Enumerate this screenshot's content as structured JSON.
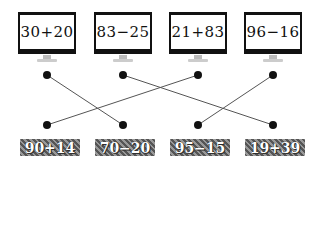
{
  "monitors": [
    {
      "expression": "30+20"
    },
    {
      "expression": "83−25"
    },
    {
      "expression": "21+83"
    },
    {
      "expression": "96−16"
    }
  ],
  "answers": [
    {
      "expression": "90+14"
    },
    {
      "expression": "70−20"
    },
    {
      "expression": "95−15"
    },
    {
      "expression": "19+39"
    }
  ],
  "connections": [
    {
      "from_top": 0,
      "to_bottom": 1
    },
    {
      "from_top": 1,
      "to_bottom": 3
    },
    {
      "from_top": 2,
      "to_bottom": 0
    },
    {
      "from_top": 3,
      "to_bottom": 2
    }
  ],
  "colors": {
    "line": "#555555",
    "dot": "#111111",
    "label_bg": "#777777"
  }
}
